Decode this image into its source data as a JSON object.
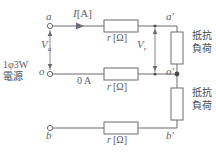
{
  "diagram": {
    "type": "single-phase-three-wire-circuit",
    "colors": {
      "wire": "#6b6b73",
      "text": "#5d5d66",
      "background": "#ffffff"
    },
    "terminals": {
      "a": "a",
      "o": "o",
      "b": "b",
      "a_prime": "a′",
      "o_prime": "o′",
      "b_prime": "b′"
    },
    "source": {
      "line1": "1φ3W",
      "line2": "電源"
    },
    "current_label": "I [A]",
    "current_value": "I",
    "current_unit": "[A]",
    "neutral_current": "0 A",
    "voltages": {
      "source_symbol": "V",
      "source_subscript": "a",
      "drop_symbol": "V",
      "drop_subscript": "r"
    },
    "resistors": {
      "symbol": "r",
      "unit": "[Ω]",
      "top_label": "r [Ω]",
      "middle_label": "r [Ω]",
      "bottom_label": "r [Ω]"
    },
    "loads": {
      "upper": {
        "line1": "抵抗",
        "line2": "負荷"
      },
      "lower": {
        "line1": "抵抗",
        "line2": "負荷"
      }
    }
  }
}
